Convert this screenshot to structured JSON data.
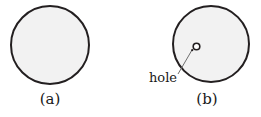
{
  "figure": {
    "panels": [
      {
        "id": "a",
        "label": "(a)",
        "description": "uniform disk",
        "disk": {
          "cx": 50,
          "cy": 45,
          "r": 39
        }
      },
      {
        "id": "b",
        "label": "(b)",
        "description": "disk with hole",
        "disk": {
          "cx": 211,
          "cy": 44,
          "r": 38
        },
        "hole": {
          "cx": 196.5,
          "cy": 46.5,
          "r": 3.3
        },
        "annotation": {
          "text": "hole",
          "leader": {
            "x1": 178,
            "y1": 74,
            "x2": 192,
            "y2": 50
          }
        }
      }
    ],
    "colors": {
      "disk_fill": "#f2f2f2",
      "disk_stroke": "#231f20",
      "hole_fill": "#ffffff",
      "leader_stroke": "#6e6e6e",
      "text": "#1a1a1a",
      "background": "#ffffff"
    }
  }
}
